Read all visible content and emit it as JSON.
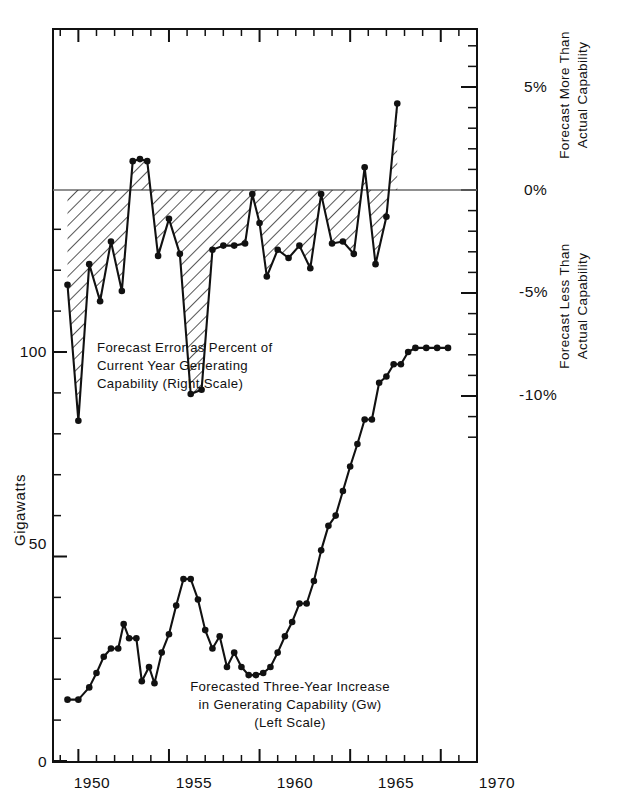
{
  "chart_data": {
    "type": "line",
    "title": "",
    "subtitle": "",
    "grid": false,
    "legend_position": "inline-annotations",
    "xlabel": "",
    "xlim": [
      1948.6,
      1972.0
    ],
    "x_major_ticks": [
      1950,
      1955,
      1960,
      1965,
      1970
    ],
    "x_tick_labels": [
      "1950",
      "1955",
      "1960",
      "1965",
      "1970"
    ],
    "x_minor_step": 1,
    "left_axis": {
      "label": "Gigawatts",
      "ylim": [
        0,
        135
      ],
      "major_ticks": [
        0,
        50,
        100
      ],
      "major_tick_labels": [
        "0",
        "50",
        "100"
      ],
      "minor_step": 10
    },
    "right_axis": {
      "label_above": "Forecast More Than\nActual Capability",
      "label_below": "Forecast Less Than\nActual Capability",
      "ylim": [
        -11.8,
        7.6
      ],
      "major_ticks": [
        5,
        0,
        -5,
        -10
      ],
      "major_tick_labels": [
        "5%",
        "0%",
        "-5%",
        "-10%"
      ],
      "minor_step": 1,
      "zero_reference": 0
    },
    "series": [
      {
        "name": "Forecast Error as Percent of Current Year Generating Capability (Right Scale)",
        "axis": "right",
        "units": "percent",
        "marker": "filled-circle",
        "fill_to_zero": true,
        "fill_style": "diagonal-hatch",
        "x": [
          1949.4,
          1950.0,
          1950.6,
          1951.2,
          1951.8,
          1952.4,
          1953.0,
          1953.4,
          1953.8,
          1954.4,
          1955.0,
          1955.6,
          1956.2,
          1956.8,
          1957.4,
          1958.0,
          1958.6,
          1959.2,
          1959.6,
          1960.0,
          1960.4,
          1961.0,
          1961.6,
          1962.2,
          1962.8,
          1963.4,
          1964.0,
          1964.6,
          1965.2,
          1965.8,
          1966.4,
          1967.0,
          1967.6
        ],
        "y": [
          -4.6,
          -11.2,
          -3.6,
          -5.4,
          -2.5,
          -4.9,
          1.4,
          1.5,
          1.4,
          -3.2,
          -1.4,
          -3.1,
          -9.9,
          -9.7,
          -2.9,
          -2.7,
          -2.7,
          -2.6,
          -0.2,
          -1.6,
          -4.2,
          -2.9,
          -3.3,
          -2.7,
          -3.8,
          -0.2,
          -2.6,
          -2.5,
          -3.1,
          1.1,
          -3.6,
          -1.3,
          4.2
        ]
      },
      {
        "name": "Forecasted Three-Year Increase in Generating Capability (Gw) (Left Scale)",
        "axis": "left",
        "units": "Gw",
        "marker": "filled-circle",
        "x": [
          1949.4,
          1950.0,
          1950.6,
          1951.0,
          1951.4,
          1951.8,
          1952.2,
          1952.5,
          1952.8,
          1953.2,
          1953.5,
          1953.9,
          1954.2,
          1954.6,
          1955.0,
          1955.4,
          1955.8,
          1956.2,
          1956.6,
          1957.0,
          1957.4,
          1957.8,
          1958.2,
          1958.6,
          1959.0,
          1959.4,
          1959.8,
          1960.2,
          1960.6,
          1961.0,
          1961.4,
          1961.8,
          1962.2,
          1962.6,
          1963.0,
          1963.4,
          1963.8,
          1964.2,
          1964.6,
          1965.0,
          1965.4,
          1965.8,
          1966.2,
          1966.6,
          1967.0,
          1967.4,
          1967.8,
          1968.2,
          1968.6,
          1969.2,
          1969.8,
          1970.4
        ],
        "y": [
          15.0,
          15.0,
          18.0,
          21.5,
          25.5,
          27.5,
          27.5,
          33.5,
          30.0,
          30.0,
          19.5,
          23.0,
          19.0,
          26.5,
          31.0,
          38.0,
          44.5,
          44.5,
          39.5,
          32.0,
          27.5,
          30.5,
          23.0,
          26.5,
          23.0,
          21.0,
          21.0,
          21.5,
          23.0,
          26.5,
          30.5,
          34.0,
          38.5,
          38.5,
          44.0,
          51.5,
          57.5,
          60.0,
          66.0,
          72.0,
          77.5,
          83.5,
          83.5,
          92.5,
          94.0,
          97.0,
          97.0,
          100.0,
          101.0,
          101.0,
          101.0,
          101.0
        ]
      }
    ],
    "annotations": [
      {
        "id": "error-annotation",
        "lines": [
          "Forecast Error as Percent of",
          "Current Year Generating",
          "Capability (Right Scale)"
        ],
        "x": 1951.0,
        "y_px": 348
      },
      {
        "id": "increase-annotation",
        "lines": [
          "Forecasted Three-Year Increase",
          "in Generating Capability (Gw)",
          "(Left Scale)"
        ],
        "x": 1958.8,
        "y_px": 690
      }
    ]
  },
  "left_axis_title": "Gigawatts",
  "right_axis_titles": {
    "upper_line1": "Forecast More Than",
    "upper_line2": "Actual Capability",
    "lower_line1": "Forecast Less Than",
    "lower_line2": "Actual Capability"
  },
  "right_tick_labels": {
    "p5": "5%",
    "p0": "0%",
    "m5": "-5%",
    "m10": "-10%"
  },
  "left_tick_labels": {
    "t100": "100",
    "t50": "50",
    "t0": "0"
  },
  "x_tick_labels": {
    "y1950": "1950",
    "y1955": "1955",
    "y1960": "1960",
    "y1965": "1965",
    "y1970": "1970"
  },
  "annotation_error": {
    "line1": "Forecast Error as Percent of",
    "line2": "Current Year Generating",
    "line3": "Capability (Right Scale)"
  },
  "annotation_increase": {
    "line1": "Forecasted Three-Year Increase",
    "line2": "in Generating Capability (Gw)",
    "line3": "(Left Scale)"
  },
  "colors": {
    "ink": "#111111",
    "background": "#ffffff",
    "hatch": "#333333",
    "zero_line": "#555555"
  }
}
